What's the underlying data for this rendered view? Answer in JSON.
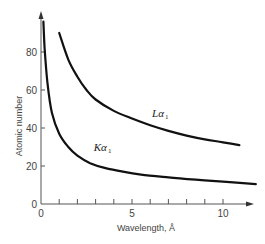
{
  "chart_data": {
    "type": "line",
    "title": "",
    "xlabel": "Wavelength, Å",
    "ylabel": "Atomic number",
    "xlim": [
      0,
      12
    ],
    "ylim": [
      0,
      100
    ],
    "x_ticks": [
      0,
      5,
      10
    ],
    "x_minor_ticks": [
      1,
      2,
      3,
      4,
      6,
      7,
      8,
      9
    ],
    "y_ticks": [
      0,
      20,
      40,
      60,
      80
    ],
    "grid": false,
    "legend": "inline labels",
    "series": [
      {
        "name": "Kα1",
        "label_main": "Kα",
        "label_sub": "1",
        "x": [
          0.13,
          0.2,
          0.35,
          0.6,
          1.0,
          1.5,
          2.0,
          2.7,
          3.5,
          4.5,
          5.5,
          7.0,
          8.5,
          10.0,
          11.8
        ],
        "values": [
          96,
          82,
          64,
          48,
          37,
          30,
          25.5,
          21.5,
          19,
          17,
          15.5,
          14,
          12.8,
          11.8,
          10.5
        ]
      },
      {
        "name": "Lα1",
        "label_main": "Lα",
        "label_sub": "1",
        "x": [
          1.0,
          1.5,
          2.0,
          2.5,
          3.0,
          4.0,
          5.0,
          6.0,
          7.0,
          8.0,
          9.0,
          10.0,
          10.9
        ],
        "values": [
          90,
          76,
          67,
          60,
          55,
          49,
          45,
          41.5,
          38.5,
          36,
          34,
          32.5,
          31
        ]
      }
    ],
    "label_positions": {
      "Kα1": {
        "x": 2.9,
        "y": 28
      },
      "Lα1": {
        "x": 6.1,
        "y": 46
      }
    }
  }
}
